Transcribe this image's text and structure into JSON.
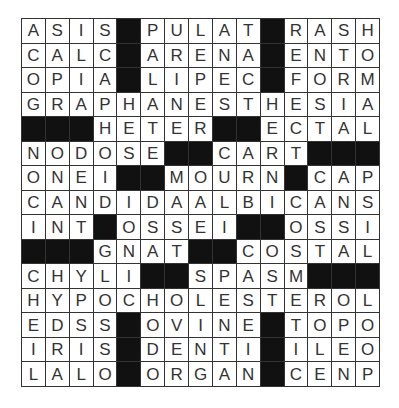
{
  "puzzle": {
    "type": "crossword-solution",
    "rows": 15,
    "cols": 15,
    "block_char": "#",
    "block_color": "#111111",
    "cell_color": "#ffffff",
    "grid": [
      "ASIS#PULAT#RASH",
      "CALC#ARENA#ENTO",
      "OPIA#LIPEC#FORM",
      "GRAPHANESTHESIA",
      "###HETER##ECTAL",
      "NODOSE##CART###",
      "ONEI##MOURN#CAP",
      "CANDIDAALBICANS",
      "INT#OSSEI##OSSI",
      "###GNAT##COSTAL",
      "CHYLI##SPASM###",
      "HYPOCHOLESTEROL",
      "EDSS#OVINE#TOPO",
      "IRIS#DENTI#ILEO",
      "LALO#ORGAN#CENP"
    ]
  }
}
